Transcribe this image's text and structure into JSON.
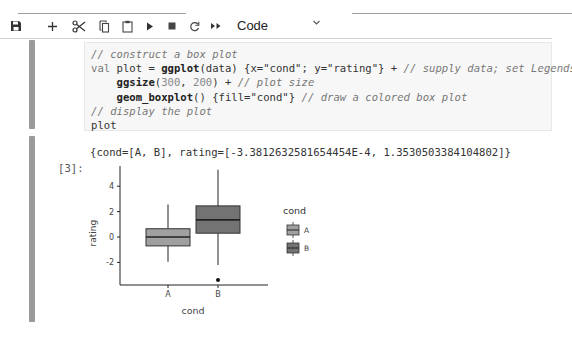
{
  "toolbar": {
    "buttons": [
      {
        "name": "save",
        "icon": "save-icon",
        "glyph": "🖫"
      },
      {
        "name": "insert-cell",
        "icon": "plus-icon",
        "glyph": "+"
      },
      {
        "name": "cut",
        "icon": "scissors-icon",
        "glyph": "✂"
      },
      {
        "name": "copy",
        "icon": "copy-icon",
        "glyph": "⧉"
      },
      {
        "name": "paste",
        "icon": "clipboard-icon",
        "glyph": "📋"
      },
      {
        "name": "run",
        "icon": "play-icon",
        "glyph": "▶"
      },
      {
        "name": "stop",
        "icon": "stop-icon",
        "glyph": "■"
      },
      {
        "name": "restart",
        "icon": "restart-icon",
        "glyph": "C"
      },
      {
        "name": "run-all",
        "icon": "fast-forward-icon",
        "glyph": "▸▸"
      }
    ],
    "cell_type": "Code",
    "cell_type_chevron": "⌄"
  },
  "code_cell": {
    "lines": [
      {
        "parts": [
          {
            "t": "// construct a box plot",
            "c": "comment"
          }
        ]
      },
      {
        "parts": [
          {
            "t": "val",
            "c": "kw"
          },
          {
            "t": " plot = ",
            "c": ""
          },
          {
            "t": "ggplot",
            "c": "fn"
          },
          {
            "t": "(data) {x=\"cond\"; y=\"rating\"} + ",
            "c": ""
          },
          {
            "t": "// supply data; set Legends",
            "c": "comment"
          }
        ]
      },
      {
        "parts": [
          {
            "t": "    ggsize",
            "c": "fn"
          },
          {
            "t": "(",
            "c": ""
          },
          {
            "t": "300",
            "c": "num"
          },
          {
            "t": ", ",
            "c": ""
          },
          {
            "t": "200",
            "c": "num"
          },
          {
            "t": ") + ",
            "c": ""
          },
          {
            "t": "// plot size",
            "c": "comment"
          }
        ]
      },
      {
        "parts": [
          {
            "t": "    geom_boxplot",
            "c": "fn"
          },
          {
            "t": "() {fill=\"cond\"} ",
            "c": ""
          },
          {
            "t": "// draw a colored box plot",
            "c": "comment"
          }
        ]
      },
      {
        "parts": [
          {
            "t": "// display the plot",
            "c": "comment"
          }
        ]
      },
      {
        "parts": [
          {
            "t": "plot",
            "c": ""
          }
        ]
      }
    ]
  },
  "output_cell": {
    "prompt": "[3]:",
    "text": "{cond=[A, B], rating=[-3.3812632581654454E-4, 1.3530503384104802]}"
  },
  "chart_data": {
    "type": "boxplot",
    "title": "",
    "xlabel": "cond",
    "ylabel": "rating",
    "categories": [
      "A",
      "B"
    ],
    "yticks": [
      -2,
      0,
      2,
      4
    ],
    "ylim": [
      -3.8,
      5.6
    ],
    "grid": false,
    "legend": {
      "title": "cond",
      "position": "right",
      "entries": [
        "A",
        "B"
      ]
    },
    "colors": {
      "A": "#a0a0a0",
      "B": "#737373"
    },
    "series": [
      {
        "name": "A",
        "whisker_low": -1.95,
        "q1": -0.7,
        "median": 0.0,
        "q3": 0.65,
        "whisker_high": 2.55,
        "outliers": []
      },
      {
        "name": "B",
        "whisker_low": -2.2,
        "q1": 0.3,
        "median": 1.35,
        "q3": 2.45,
        "whisker_high": 5.3,
        "outliers": [
          -3.38
        ]
      }
    ]
  }
}
